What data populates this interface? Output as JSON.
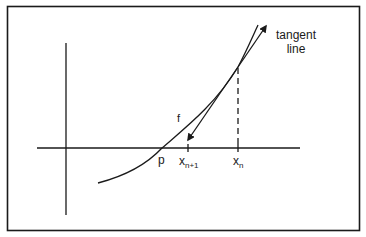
{
  "figure": {
    "colors": {
      "ink": "#1a1a1a",
      "background": "#ffffff"
    },
    "labels": {
      "tangent_line_1": "tangent",
      "tangent_line_2": "line",
      "function": "f",
      "root": "p",
      "x_next_base": "x",
      "x_next_sub": "n+1",
      "x_n_base": "x",
      "x_n_sub": "n"
    }
  }
}
